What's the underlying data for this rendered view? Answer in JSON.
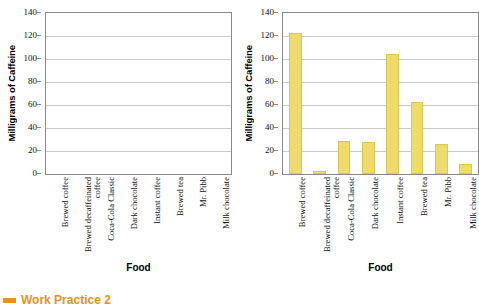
{
  "chart_data": [
    {
      "type": "bar",
      "name": "empty-template-chart",
      "title": "",
      "xlabel": "Food",
      "ylabel": "Milligrams of Caffeine",
      "categories": [
        "Brewed coffee",
        "Brewed decaffeinated coffee",
        "Coca-Cola Classic",
        "Dark chocolate",
        "Instant coffee",
        "Brewed tea",
        "Mr. Pibb",
        "Milk chocolate"
      ],
      "values": [
        null,
        null,
        null,
        null,
        null,
        null,
        null,
        null
      ],
      "yticks": [
        0,
        20,
        40,
        60,
        80,
        100,
        120,
        140
      ],
      "ylim": [
        0,
        140
      ],
      "grid": true,
      "legend": "none",
      "bar_color": "#efdb69"
    },
    {
      "type": "bar",
      "name": "caffeine-bar-chart",
      "title": "",
      "xlabel": "Food",
      "ylabel": "Milligrams of Caffeine",
      "categories": [
        "Brewed coffee",
        "Brewed decaffeinated coffee",
        "Coca-Cola Classic",
        "Dark chocolate",
        "Instant coffee",
        "Brewed tea",
        "Mr. Pibb",
        "Milk chocolate"
      ],
      "values": [
        123,
        3,
        29,
        28,
        104,
        63,
        26,
        9
      ],
      "yticks": [
        0,
        20,
        40,
        60,
        80,
        100,
        120,
        140
      ],
      "ylim": [
        0,
        140
      ],
      "grid": true,
      "legend": "none",
      "bar_color": "#efdb69"
    }
  ],
  "footer": {
    "marker": "orange-square-bullet",
    "label": "Work Practice 2",
    "color": "#e8921f"
  }
}
